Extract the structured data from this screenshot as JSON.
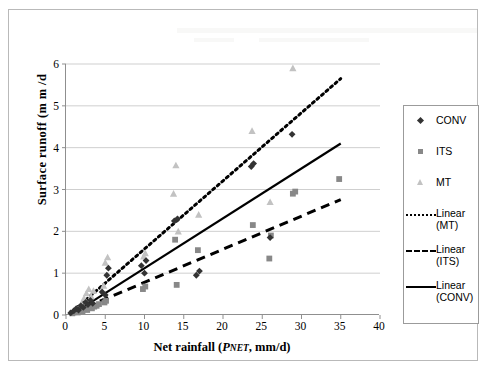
{
  "chart_data": {
    "type": "scatter",
    "title": "",
    "xlabel": "Net rainfall (PNET, mm/d)",
    "xlabel_parts": {
      "prefix": "Net rainfall (",
      "symbol": "P",
      "subscript": "NET",
      "suffix": ", mm/d)"
    },
    "ylabel": "Surface runoff (m m /d",
    "xlim": [
      0,
      40
    ],
    "ylim": [
      0,
      6
    ],
    "xticks": [
      0,
      5,
      10,
      15,
      20,
      25,
      30,
      35,
      40
    ],
    "yticks": [
      0,
      1,
      2,
      3,
      4,
      5,
      6
    ],
    "grid": "horizontal",
    "legend_position": "right",
    "colors": {
      "conv_marker": "#333333",
      "its_marker": "#888888",
      "mt_marker": "#c2c2c2",
      "trendline": "#000000",
      "gridline": "#cfcfcf",
      "axis": "#8f8f8f",
      "frame": "#b9b9b9"
    },
    "series": [
      {
        "name": "CONV",
        "marker": "diamond",
        "color": "#333333",
        "points": [
          [
            0.6,
            0.05
          ],
          [
            1.0,
            0.1
          ],
          [
            1.3,
            0.15
          ],
          [
            1.6,
            0.12
          ],
          [
            1.9,
            0.22
          ],
          [
            2.2,
            0.18
          ],
          [
            2.5,
            0.3
          ],
          [
            2.8,
            0.25
          ],
          [
            3.1,
            0.35
          ],
          [
            3.4,
            0.28
          ],
          [
            4.6,
            0.55
          ],
          [
            5.0,
            0.48
          ],
          [
            5.2,
            0.95
          ],
          [
            5.4,
            1.12
          ],
          [
            9.6,
            1.18
          ],
          [
            10.0,
            1.0
          ],
          [
            10.2,
            1.3
          ],
          [
            13.8,
            2.25
          ],
          [
            14.2,
            2.3
          ],
          [
            16.6,
            0.95
          ],
          [
            17.0,
            1.05
          ],
          [
            23.6,
            3.55
          ],
          [
            23.9,
            3.62
          ],
          [
            26.0,
            1.85
          ],
          [
            28.8,
            4.32
          ]
        ]
      },
      {
        "name": "ITS",
        "marker": "square",
        "color": "#888888",
        "points": [
          [
            0.8,
            0.04
          ],
          [
            1.2,
            0.08
          ],
          [
            1.5,
            0.06
          ],
          [
            1.8,
            0.1
          ],
          [
            2.1,
            0.09
          ],
          [
            2.4,
            0.14
          ],
          [
            2.7,
            0.12
          ],
          [
            3.0,
            0.18
          ],
          [
            3.3,
            0.16
          ],
          [
            3.6,
            0.2
          ],
          [
            3.9,
            0.22
          ],
          [
            4.2,
            0.26
          ],
          [
            4.9,
            0.3
          ],
          [
            5.1,
            0.34
          ],
          [
            9.8,
            0.62
          ],
          [
            10.1,
            0.68
          ],
          [
            13.9,
            1.8
          ],
          [
            14.1,
            0.72
          ],
          [
            16.8,
            1.55
          ],
          [
            23.8,
            2.15
          ],
          [
            25.9,
            1.35
          ],
          [
            26.1,
            1.9
          ],
          [
            28.9,
            2.9
          ],
          [
            29.2,
            2.95
          ],
          [
            34.8,
            3.25
          ]
        ]
      },
      {
        "name": "MT",
        "marker": "triangle",
        "color": "#c2c2c2",
        "points": [
          [
            0.9,
            0.06
          ],
          [
            1.4,
            0.12
          ],
          [
            1.7,
            0.2
          ],
          [
            2.0,
            0.28
          ],
          [
            2.3,
            0.4
          ],
          [
            2.6,
            0.52
          ],
          [
            2.9,
            0.62
          ],
          [
            3.2,
            0.45
          ],
          [
            3.5,
            0.58
          ],
          [
            4.8,
            0.7
          ],
          [
            5.0,
            1.25
          ],
          [
            5.3,
            1.38
          ],
          [
            9.9,
            1.4
          ],
          [
            10.1,
            1.48
          ],
          [
            13.7,
            2.9
          ],
          [
            14.0,
            3.58
          ],
          [
            14.3,
            2.0
          ],
          [
            16.9,
            2.4
          ],
          [
            23.7,
            4.4
          ],
          [
            26.0,
            2.7
          ],
          [
            28.9,
            5.9
          ]
        ]
      }
    ],
    "trendlines": [
      {
        "name": "Linear (MT)",
        "style": "dotted",
        "x0": 0.8,
        "y0": 0.08,
        "x1": 35.0,
        "y1": 5.65
      },
      {
        "name": "Linear (ITS)",
        "style": "dashed",
        "x0": 0.8,
        "y0": 0.05,
        "x1": 35.0,
        "y1": 2.76
      },
      {
        "name": "Linear (CONV)",
        "style": "solid",
        "x0": 0.8,
        "y0": 0.02,
        "x1": 35.0,
        "y1": 4.1
      }
    ],
    "legend_entries": [
      {
        "label": "CONV",
        "key": "diamond-marker"
      },
      {
        "label": "ITS",
        "key": "square-marker"
      },
      {
        "label": "MT",
        "key": "triangle-marker"
      },
      {
        "label": "Linear\n(MT)",
        "key": "dotted-line"
      },
      {
        "label": "Linear\n(ITS)",
        "key": "dashed-line"
      },
      {
        "label": "Linear\n(CONV)",
        "key": "solid-line"
      }
    ]
  }
}
